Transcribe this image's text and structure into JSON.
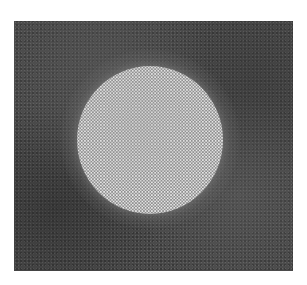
{
  "image": {
    "description": "Grayscale image of a bright circular disc composed of densely packed light dots, centered on a dark, mottled textured square field",
    "background_color": "#ffffff",
    "field": {
      "x": 14,
      "y": 21,
      "width": 279,
      "height": 250,
      "color": "#4a4a4a"
    },
    "disc": {
      "center_x": 150,
      "center_y": 139,
      "radius": 73,
      "base_color": "#8e8e8e",
      "dot_color": "#e8e8e8"
    },
    "halo": {
      "radius": 90,
      "color": "#6e6e6e"
    }
  }
}
